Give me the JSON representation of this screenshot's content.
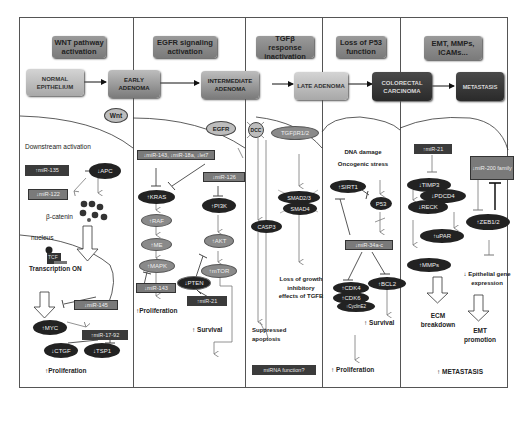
{
  "headers": [
    {
      "label": "WNT pathway activation"
    },
    {
      "label": "EGFR signaling activation"
    },
    {
      "label": "TGFβ response inactivation"
    },
    {
      "label": "Loss of P53 function"
    },
    {
      "label": "EMT, MMPs, ICAMs..."
    }
  ],
  "stages": [
    {
      "label": "NORMAL EPITHELIUM"
    },
    {
      "label": "EARLY ADENOMA"
    },
    {
      "label": "INTERMEDIATE ADENOMA"
    },
    {
      "label": "LATE ADENOMA"
    },
    {
      "label": "COLORECTAL CARCINOMA"
    },
    {
      "label": "METASTASIS"
    }
  ],
  "wnt": {
    "receptor": "Wnt",
    "downstream": "Downstream activation",
    "mir135": "↑miR-135",
    "apc": "↓APC",
    "mir122": "↓miR-122",
    "bcatenin": "β-catenin",
    "nucleus": "nucleus",
    "tcf": "TCF",
    "transcription": "Transcription ON",
    "mir145": "↓miR-145",
    "myc": "↑MYC",
    "mir1792": "↑miR-17-92",
    "ctgf": "↓CTGF",
    "tsp1": "↓TSP1",
    "outcome": "↑Proliferation"
  },
  "egfr": {
    "receptor": "EGFR",
    "mirs": "↓miR-143, ↓miR-18a, ↓let7",
    "mir126": "↓miR-126",
    "kras": "↑KRAS",
    "raf": "↑RAF",
    "me": "↑ME",
    "mapk": "↑MAPK",
    "mir143": "↓miR-143",
    "pi3k": "↑PI3K",
    "akt": "↑AKT",
    "mtor": "↑mTOR",
    "pten": "↓PTEN",
    "mir21": "↑miR-21",
    "outcome_prolif": "↑Proliferation",
    "outcome_survival": "↑ Survival"
  },
  "tgfb": {
    "dcc": "DCC",
    "receptor": "TGFβR1/2",
    "smad": "SMAD2/3",
    "smad4": "SMAD4",
    "casp3": "CASP3",
    "loss": "Loss of growth inhibitory effects of TGFB",
    "apoptosis": "Suppressed apoptosis",
    "mirna": "miRNA function?"
  },
  "p53": {
    "stress1": "DNA damage",
    "stress2": "Oncogenic stress",
    "sirt1": "↑SIRT1",
    "p53": "P53",
    "mir34": "↓miR-34a-c",
    "cdk4": "↑CDK4",
    "cdk6": "↑CDK6",
    "cyclin": "↑CyclinE2",
    "bcl2": "↑BCL2",
    "survival": "↑ Survival",
    "proliferation": "↑ Proliferation"
  },
  "emt": {
    "mir21": "↑miR-21",
    "mir200": "↓miR-200 family",
    "timp3": "↓TIMP3",
    "pdcd4": "↓PDCD4",
    "reck": "↓RECK",
    "upar": "↑uPAR",
    "mmps": "↑MMPs",
    "zeb": "↑ZEB1/2",
    "epithelial": "↓ Epithelial gene expression",
    "ecm": "ECM breakdown",
    "emtprom": "EMT promotion",
    "outcome": "↑ METASTASIS"
  }
}
